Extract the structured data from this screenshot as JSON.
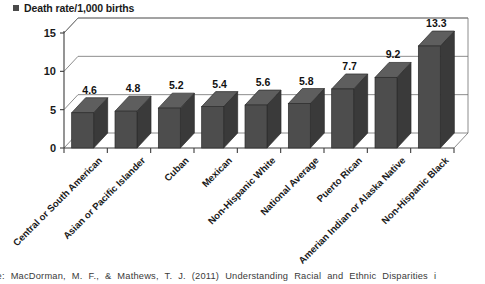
{
  "legend": {
    "marker": "square-marker",
    "label": "Death rate/1,000 births"
  },
  "source": {
    "text": "urce: MacDorman, M. F., & Mathews, T. J. (2011) Understanding Racial and Ethnic Disparities i"
  },
  "chart_data": {
    "type": "bar",
    "title": "",
    "subtitle": "",
    "xlabel": "",
    "ylabel": "",
    "legend_entries": [
      "Death rate/1,000 births"
    ],
    "legend_position": "top-left",
    "grid": true,
    "three_d": true,
    "ylim": [
      0,
      15
    ],
    "yticks": [
      0,
      5,
      10,
      15
    ],
    "ytick_labels": [
      "0",
      "5",
      "10",
      "15"
    ],
    "categories": [
      "Central or South American",
      "Asian or Pacific Islander",
      "Cuban",
      "Mexican",
      "Non-Hispanic White",
      "National Average",
      "Puerto Rican",
      "Amerian Indian or Alaska Native",
      "Non-Hispanic Black"
    ],
    "values": [
      4.6,
      4.8,
      5.2,
      5.4,
      5.6,
      5.8,
      7.7,
      9.2,
      13.3
    ],
    "data_labels": [
      "4.6",
      "4.8",
      "5.2",
      "5.4",
      "5.6",
      "5.8",
      "7.7",
      "9.2",
      "13.3"
    ],
    "series": [
      {
        "name": "Death rate/1,000 births",
        "values": [
          4.6,
          4.8,
          5.2,
          5.4,
          5.6,
          5.8,
          7.7,
          9.2,
          13.3
        ],
        "color": "#4d4d4d"
      }
    ],
    "colors": {
      "bar_front": "#4d4d4d",
      "bar_side": "#3a3a3a",
      "bar_top": "#5e5e5e",
      "gridline": "#6e6e6e",
      "axis": "#3d3d3d",
      "text": "#1a1a1a"
    }
  }
}
